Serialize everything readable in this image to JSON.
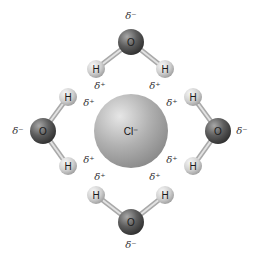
{
  "diagram": {
    "ion": {
      "label": "Cl⁻",
      "cx": 131,
      "cy": 131,
      "r": 37,
      "color": "#a8a8a8"
    },
    "colors": {
      "oxygen": "#555555",
      "hydrogen": "#cfcfcf",
      "bond": "#bdbdbd"
    },
    "molecules": [
      {
        "name": "water-top",
        "O": {
          "label": "O",
          "cx": 131,
          "cy": 42
        },
        "H1": {
          "label": "H",
          "cx": 96,
          "cy": 69
        },
        "H2": {
          "label": "H",
          "cx": 165,
          "cy": 69
        },
        "delta_minus": {
          "label": "δ⁻",
          "x": 131,
          "y": 19
        },
        "delta_plus_1": {
          "label": "δ⁺",
          "x": 100,
          "y": 89
        },
        "delta_plus_2": {
          "label": "δ⁺",
          "x": 155,
          "y": 89
        }
      },
      {
        "name": "water-left",
        "O": {
          "label": "O",
          "cx": 43,
          "cy": 131
        },
        "H1": {
          "label": "H",
          "cx": 68,
          "cy": 97
        },
        "H2": {
          "label": "H",
          "cx": 68,
          "cy": 166
        },
        "delta_minus": {
          "label": "δ⁻",
          "x": 18,
          "y": 134
        },
        "delta_plus_1": {
          "label": "δ⁺",
          "x": 89,
          "y": 106
        },
        "delta_plus_2": {
          "label": "δ⁺",
          "x": 89,
          "y": 163
        }
      },
      {
        "name": "water-right",
        "O": {
          "label": "O",
          "cx": 218,
          "cy": 131
        },
        "H1": {
          "label": "H",
          "cx": 193,
          "cy": 97
        },
        "H2": {
          "label": "H",
          "cx": 193,
          "cy": 166
        },
        "delta_minus": {
          "label": "δ⁻",
          "x": 242,
          "y": 134
        },
        "delta_plus_1": {
          "label": "δ⁺",
          "x": 172,
          "y": 106
        },
        "delta_plus_2": {
          "label": "δ⁺",
          "x": 172,
          "y": 163
        }
      },
      {
        "name": "water-bottom",
        "O": {
          "label": "O",
          "cx": 131,
          "cy": 222
        },
        "H1": {
          "label": "H",
          "cx": 96,
          "cy": 195
        },
        "H2": {
          "label": "H",
          "cx": 165,
          "cy": 195
        },
        "delta_minus": {
          "label": "δ⁻",
          "x": 131,
          "y": 248
        },
        "delta_plus_1": {
          "label": "δ⁺",
          "x": 100,
          "y": 180
        },
        "delta_plus_2": {
          "label": "δ⁺",
          "x": 155,
          "y": 180
        }
      }
    ]
  }
}
